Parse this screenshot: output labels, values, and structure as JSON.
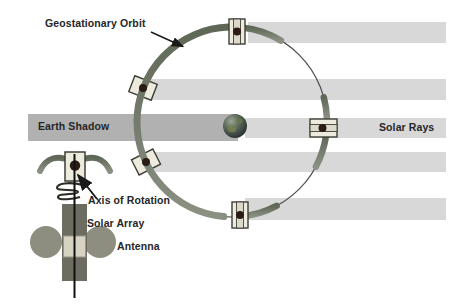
{
  "figure": {
    "type": "diagram",
    "topic": "Geostationary orbit with spin-stabilized satellites, solar rays and Earth shadow",
    "satellite_count_on_orbit": 5
  },
  "labels": {
    "geostationary_orbit": "Geostationary Orbit",
    "earth_shadow": "Earth Shadow",
    "solar_rays": "Solar Rays",
    "axis_of_rotation": "Axis of Rotation",
    "solar_array": "Solar Array",
    "antenna": "Antenna"
  },
  "icons": {
    "earth-globe-icon": "dark shaded sphere at orbit center",
    "satellite-box-icon": "light rectangle with center stripe and dark hub dot",
    "orbit-wing-icon": "curved olive crescent solar sail along orbit",
    "spring-coil-icon": "coiled spring marking spin axis on inset satellite",
    "arrow-pointer-icon": "thin black arrow with filled triangular head"
  },
  "colors": {
    "background": "#ffffff",
    "solar_ray_bar": "#d8d8d8",
    "earth_shadow_bar": "#b1b1b1",
    "orbit_line": "#4d4d4d",
    "orbit_band": "#717a69",
    "satellite_body": "#edeade",
    "satellite_outline": "#3f3f38",
    "satellite_hub_dot": "#2b1d16",
    "inset_array_bar": "#6c6c60",
    "inset_antenna_dish": "#8d8d80",
    "label_text": "#262626"
  }
}
